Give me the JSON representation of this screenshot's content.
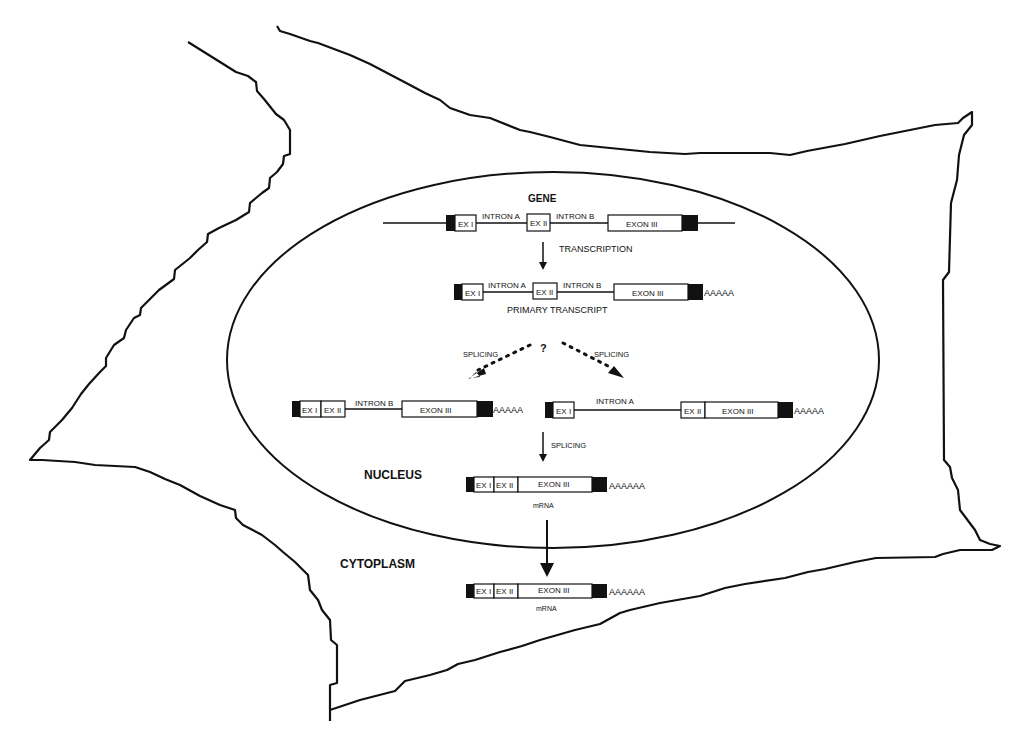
{
  "diagram": {
    "title_gene": "GENE",
    "compartments": {
      "nucleus": "NUCLEUS",
      "cytoplasm": "CYTOPLASM"
    },
    "steps": {
      "transcription": "TRANSCRIPTION",
      "primary_transcript": "PRIMARY TRANSCRIPT",
      "question": "?",
      "splicing_left": "SPLICING",
      "splicing_right": "SPLICING",
      "splicing_down": "SPLICING",
      "mrna_nucleus": "mRNA",
      "mrna_cytoplasm": "mRNA"
    },
    "gene_row": {
      "ex1": "EX I",
      "intron_a": "INTRON A",
      "ex2": "EX II",
      "intron_b": "INTRON B",
      "ex3": "EXON III"
    },
    "primary_row": {
      "ex1": "EX I",
      "intron_a": "INTRON A",
      "ex2": "EX II",
      "intron_b": "INTRON B",
      "ex3": "EXON III",
      "polya": "AAAAA"
    },
    "intermediate_left": {
      "ex1": "EX I",
      "ex2": "EX II",
      "intron_b": "INTRON B",
      "ex3": "EXON III",
      "polya": "AAAAA"
    },
    "intermediate_right": {
      "ex1": "EX I",
      "intron_a": "INTRON A",
      "ex2": "EX II",
      "ex3": "EXON III",
      "polya": "AAAAA"
    },
    "mrna_nuclear_row": {
      "ex1": "EX I",
      "ex2": "EX II",
      "ex3": "EXON III",
      "polya": "AAAAAA"
    },
    "mrna_cyto_row": {
      "ex1": "EX I",
      "ex2": "EX II",
      "ex3": "EXON III",
      "polya": "AAAAAA"
    },
    "colors": {
      "stroke": "#111111",
      "utr_fill": "#111111",
      "exon_fill": "#ffffff",
      "background": "#ffffff"
    }
  }
}
